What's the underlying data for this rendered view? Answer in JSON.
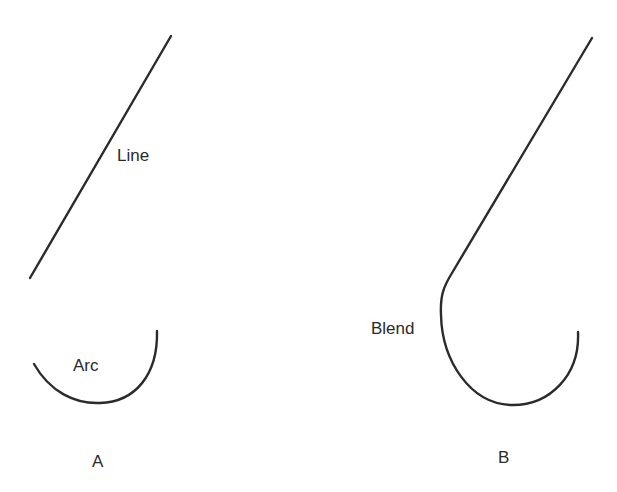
{
  "diagram": {
    "panel_a": {
      "caption": "A",
      "line_label": "Line",
      "arc_label": "Arc",
      "line": {
        "x1": 30,
        "y1": 278,
        "x2": 171,
        "y2": 36
      },
      "arc": {
        "start": [
          34,
          364
        ],
        "end": [
          157,
          331
        ],
        "bottom": [
          96,
          403
        ]
      }
    },
    "panel_b": {
      "caption": "B",
      "blend_label": "Blend",
      "line": {
        "x1": 592,
        "y1": 38,
        "x2": 450,
        "y2": 278
      },
      "blend_end": [
        578,
        332
      ]
    },
    "colors": {
      "stroke": "#2b2b2b",
      "text": "#2a2a2a",
      "background": "#ffffff"
    }
  }
}
